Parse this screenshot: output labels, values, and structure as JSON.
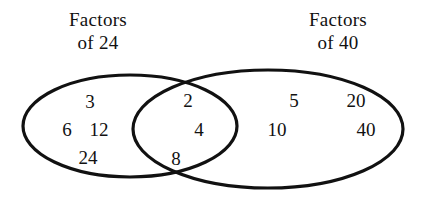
{
  "diagram": {
    "type": "venn-two-set",
    "background_color": "#ffffff",
    "stroke_color": "#111111",
    "left_label": {
      "line1": "Factors",
      "line2": "of 24"
    },
    "right_label": {
      "line1": "Factors",
      "line2": "of 40"
    },
    "regions": {
      "left_only": {
        "set_name": "Factors of 24",
        "values": [
          "3",
          "6",
          "12",
          "24"
        ]
      },
      "intersection": {
        "set_name": "Common factors of 24 and 40",
        "values": [
          "2",
          "4",
          "8"
        ]
      },
      "right_only": {
        "set_name": "Factors of 40",
        "values": [
          "5",
          "20",
          "10",
          "40"
        ]
      }
    },
    "numbers": [
      {
        "value": "3",
        "region": "left_only",
        "x": 90,
        "y": 101
      },
      {
        "value": "6",
        "region": "left_only",
        "x": 67,
        "y": 129
      },
      {
        "value": "12",
        "region": "left_only",
        "x": 99,
        "y": 129
      },
      {
        "value": "24",
        "region": "left_only",
        "x": 88,
        "y": 157
      },
      {
        "value": "2",
        "region": "intersection",
        "x": 188,
        "y": 100
      },
      {
        "value": "4",
        "region": "intersection",
        "x": 199,
        "y": 129
      },
      {
        "value": "8",
        "region": "intersection",
        "x": 176,
        "y": 158
      },
      {
        "value": "5",
        "region": "right_only",
        "x": 294,
        "y": 100
      },
      {
        "value": "20",
        "region": "right_only",
        "x": 356,
        "y": 100
      },
      {
        "value": "10",
        "region": "right_only",
        "x": 277,
        "y": 129
      },
      {
        "value": "40",
        "region": "right_only",
        "x": 366,
        "y": 129
      }
    ]
  }
}
